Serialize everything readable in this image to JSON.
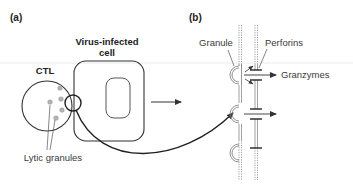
{
  "panels": {
    "a": {
      "label": "(a)",
      "ctl_label": "CTL",
      "cell_title_line1": "Virus-infected",
      "cell_title_line2": "cell",
      "granules_label": "Lytic granules"
    },
    "b": {
      "label": "(b)",
      "granule_label": "Granule",
      "perforins_label": "Perforins",
      "granzymes_label": "Granzymes"
    }
  },
  "colors": {
    "line": "#333333",
    "granule_fill": "#b0b0b0",
    "membrane": "#888888"
  }
}
